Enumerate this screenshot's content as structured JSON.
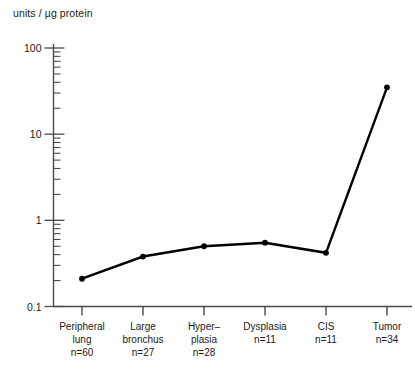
{
  "chart_data": {
    "type": "line",
    "title": "units / µg protein",
    "xlabel": "",
    "ylabel": "units / µg protein",
    "yscale": "log",
    "ylim": [
      0.1,
      100
    ],
    "ytick_labels": [
      "100",
      "10",
      "1",
      "0.1"
    ],
    "ytick_values": [
      100,
      10,
      1,
      0.1
    ],
    "grid": false,
    "legend": "none",
    "marker": "filled-circle",
    "line_color": "#000000",
    "categories": [
      "Peripheral lung",
      "Large bronchus",
      "Hyper-plasia",
      "Dysplasia",
      "CIS",
      "Tumor"
    ],
    "category_lines": [
      [
        "Peripheral",
        "lung",
        "n=60"
      ],
      [
        "Large",
        "bronchus",
        "n=27"
      ],
      [
        "Hyper–",
        "plasia",
        "n=28"
      ],
      [
        "Dysplasia",
        "n=11"
      ],
      [
        "CIS",
        "n=11"
      ],
      [
        "Tumor",
        "n=34"
      ]
    ],
    "sample_sizes": [
      60,
      27,
      28,
      11,
      11,
      34
    ],
    "values": [
      0.21,
      0.38,
      0.5,
      0.55,
      0.42,
      35
    ]
  }
}
